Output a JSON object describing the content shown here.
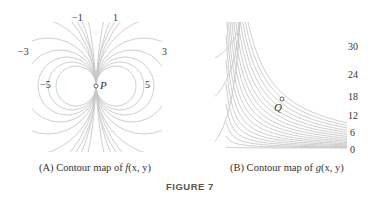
{
  "panel_a": {
    "caption_prefix": "(A) Contour map of ",
    "caption_func": "f",
    "caption_args": "(x, y)",
    "point_label": "P",
    "level_labels": [
      {
        "text": "−1",
        "x": 72,
        "y": 13
      },
      {
        "text": "1",
        "x": 113,
        "y": 13
      },
      {
        "text": "−3",
        "x": 18,
        "y": 47
      },
      {
        "text": "3",
        "x": 162,
        "y": 47
      },
      {
        "text": "−5",
        "x": 40,
        "y": 80
      },
      {
        "text": "5",
        "x": 145,
        "y": 80
      }
    ]
  },
  "panel_b": {
    "caption_prefix": "(B) Contour map of ",
    "caption_func": "g",
    "caption_args": "(x, y)",
    "point_label": "Q",
    "level_labels": [
      {
        "text": "30",
        "x": 348,
        "y": 42
      },
      {
        "text": "24",
        "x": 348,
        "y": 70
      },
      {
        "text": "18",
        "x": 348,
        "y": 92
      },
      {
        "text": "12",
        "x": 348,
        "y": 111
      },
      {
        "text": "6",
        "x": 350,
        "y": 128
      },
      {
        "text": "0",
        "x": 350,
        "y": 145
      }
    ]
  },
  "figure_label": "FIGURE 7",
  "colors": {
    "contour": "#c8c8c8",
    "text": "#333333"
  }
}
